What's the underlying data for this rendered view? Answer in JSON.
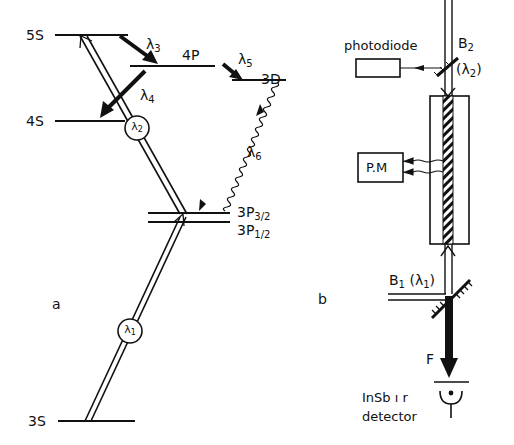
{
  "panel_a": {
    "label": "a",
    "levels": {
      "s5": "5S",
      "p4": "4P",
      "d3": "3D",
      "s4": "4S",
      "p32": {
        "main": "3P",
        "sub": "3/2"
      },
      "p12": {
        "main": "3P",
        "sub": "1/2"
      },
      "s3": "3S"
    },
    "transitions": {
      "lambda1": {
        "sym": "λ",
        "sub": "1"
      },
      "lambda2": {
        "sym": "λ",
        "sub": "2"
      },
      "lambda3": {
        "sym": "λ",
        "sub": "3"
      },
      "lambda4": {
        "sym": "λ",
        "sub": "4"
      },
      "lambda5": {
        "sym": "λ",
        "sub": "5"
      },
      "lambda6": {
        "sym": "λ",
        "sub": "6"
      }
    }
  },
  "panel_b": {
    "label": "b",
    "photodiode": "photodiode",
    "pm": "P.M",
    "beam2": {
      "name": "B",
      "sub": "2",
      "wl": "(λ",
      "wl_sub": "2",
      "close": ")"
    },
    "beam1": {
      "name": "B",
      "sub": "1",
      "wl": "(λ",
      "wl_sub": "1",
      "close": ")"
    },
    "filter": "F",
    "detector_line1": "InSb ı r",
    "detector_line2": "detector"
  }
}
